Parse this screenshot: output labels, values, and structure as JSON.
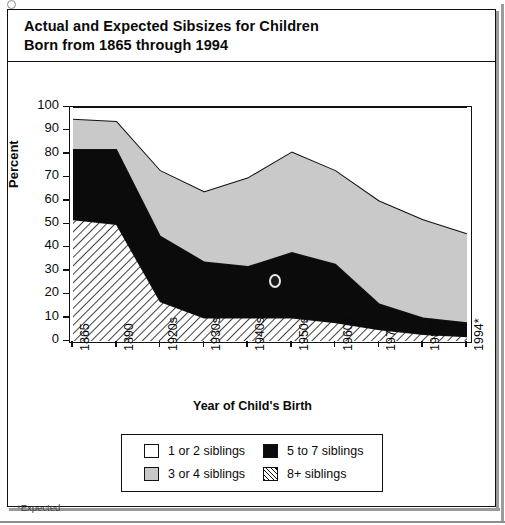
{
  "document": {
    "title_line1": "Actual and Expected Sibsizes for Children",
    "title_line2": "Born from 1865 through 1994",
    "footnote": "*Expected"
  },
  "colors": {
    "series_1_or_2": "#ffffff",
    "series_3_or_4": "#c9c9c9",
    "series_5_to_7": "#0b0b0b",
    "series_8plus": "#ffffff",
    "axis": "#111111",
    "frame": "#111111"
  },
  "legend": {
    "position": "bottom-center",
    "entries": [
      {
        "label": "1 or 2 siblings",
        "pattern": "solid-white"
      },
      {
        "label": "3 or 4 siblings",
        "pattern": "solid-gray"
      },
      {
        "label": "5 to 7 siblings",
        "pattern": "solid-black"
      },
      {
        "label": "8+ siblings",
        "pattern": "diagonal-hatch"
      }
    ]
  },
  "chart_data": {
    "type": "area",
    "stacked": true,
    "title": "Actual and Expected Sibsizes for Children Born from 1865 through 1994",
    "xlabel": "Year of Child's Birth",
    "ylabel": "Percent",
    "ylim": [
      0,
      100
    ],
    "yticks": [
      0,
      10,
      20,
      30,
      40,
      50,
      60,
      70,
      80,
      90,
      100
    ],
    "grid": false,
    "legend_position": "bottom",
    "categories": [
      "1865",
      "1890",
      "1920s",
      "1930s",
      "1940s",
      "1950s",
      "1960s",
      "1973*",
      "1983*",
      "1994*"
    ],
    "series": [
      {
        "name": "8+ siblings",
        "stack_order": 1,
        "values": [
          52,
          50,
          17,
          10,
          10,
          10,
          8,
          5,
          3,
          2
        ]
      },
      {
        "name": "5 to 7 siblings",
        "stack_order": 2,
        "values": [
          30,
          32,
          28,
          24,
          22,
          28,
          25,
          11,
          7,
          6
        ]
      },
      {
        "name": "3 or 4 siblings",
        "stack_order": 3,
        "values": [
          13,
          12,
          28,
          30,
          38,
          43,
          40,
          44,
          42,
          38
        ]
      },
      {
        "name": "1 or 2 siblings",
        "stack_order": 4,
        "values": [
          5,
          6,
          27,
          36,
          30,
          19,
          27,
          40,
          48,
          54
        ]
      }
    ],
    "cumulative_tops": {
      "8+ siblings": [
        52,
        50,
        17,
        10,
        10,
        10,
        8,
        5,
        3,
        2
      ],
      "5 to 7 siblings": [
        82,
        82,
        45,
        34,
        32,
        38,
        33,
        16,
        10,
        8
      ],
      "3 or 4 siblings": [
        95,
        94,
        73,
        64,
        70,
        81,
        73,
        60,
        52,
        46
      ]
    },
    "annotations": [
      "*Expected"
    ]
  }
}
